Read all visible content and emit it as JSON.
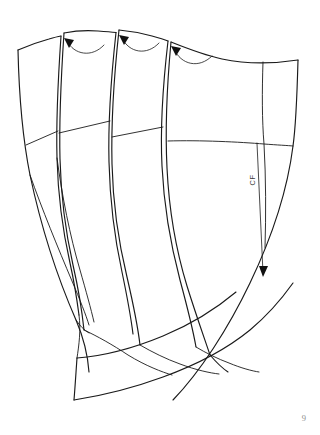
{
  "page": {
    "number_label": "9",
    "background_color": "#ffffff",
    "ink_color": "#1a1a1a",
    "width": 320,
    "height": 435
  },
  "figure": {
    "kind": "sewing-pattern-draft",
    "panel_count": 4,
    "panels": [
      {
        "id": "gore-1",
        "name": "side-gore-panel",
        "label": ""
      },
      {
        "id": "gore-2",
        "name": "second-gore-panel",
        "label": ""
      },
      {
        "id": "gore-3",
        "name": "third-gore-panel",
        "label": ""
      },
      {
        "id": "gore-4",
        "name": "center-front-panel",
        "label": ""
      }
    ],
    "grainline": {
      "label": "CF",
      "orientation": "vertical",
      "text_rotation_deg": -90,
      "has_arrowhead": true,
      "arrow_direction": "down"
    },
    "rotation_arrows": [
      {
        "id": "arrow-1",
        "name": "dart-rotation-arrow-left",
        "direction": "left"
      },
      {
        "id": "arrow-2",
        "name": "dart-rotation-arrow-middle",
        "direction": "left"
      },
      {
        "id": "arrow-3",
        "name": "dart-rotation-arrow-right",
        "direction": "left"
      }
    ],
    "balance_lines": [
      {
        "id": "hipline-1",
        "name": "hip-balance-line-gore-1"
      },
      {
        "id": "hipline-2",
        "name": "hip-balance-line-gore-2"
      },
      {
        "id": "hipline-3",
        "name": "hip-balance-line-gore-3"
      },
      {
        "id": "hipline-4",
        "name": "hip-balance-line-center-front"
      }
    ]
  },
  "colors": {
    "ink": "#1a1a1a",
    "inner_line": "#2b2b2b",
    "page_number": "#8d8d8d",
    "label": "#3a3a3a",
    "paper": "#ffffff"
  }
}
